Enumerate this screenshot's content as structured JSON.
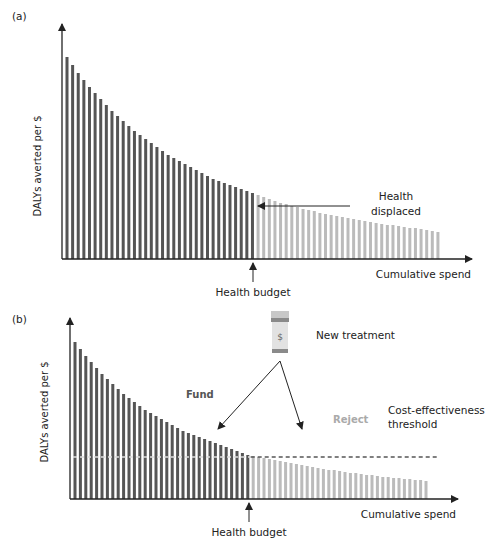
{
  "chart_data": [
    {
      "type": "bar",
      "panel": "(a)",
      "title": "",
      "xlabel": "Cumulative spend",
      "ylabel": "DALYs averted per $",
      "grid": false,
      "legend": null,
      "bar_count": 67,
      "funded_bar_count": 34,
      "values": [
        202,
        194,
        186,
        179,
        172,
        166,
        160,
        154,
        148,
        143,
        138,
        133,
        128,
        124,
        120,
        116,
        112,
        108,
        104,
        101,
        98,
        95,
        92,
        89,
        86,
        83,
        80,
        78,
        76,
        74,
        72,
        70,
        68,
        66,
        64,
        62,
        60,
        58,
        56,
        55,
        53,
        52,
        50,
        49,
        48,
        46,
        45,
        44,
        43,
        42,
        41,
        40,
        39,
        38,
        37,
        36,
        35,
        34,
        34,
        33,
        32,
        31,
        31,
        30,
        29,
        28,
        27
      ],
      "series": [
        {
          "name": "Funded (within budget)",
          "color": "#555555",
          "range": [
            0,
            33
          ]
        },
        {
          "name": "Unfunded (beyond budget)",
          "color": "#bbbbbb",
          "range": [
            34,
            66
          ]
        }
      ],
      "annotations": [
        {
          "text": "Health budget",
          "type": "arrow-up",
          "at_bar": 33
        },
        {
          "text": "Health displaced",
          "type": "arrow-left",
          "at_bar": 34
        }
      ]
    },
    {
      "type": "bar",
      "panel": "(b)",
      "title": "",
      "xlabel": "Cumulative spend",
      "ylabel": "DALYs averted per $",
      "grid": false,
      "legend": null,
      "bar_count": 66,
      "funded_bar_count": 33,
      "values": [
        157,
        150,
        143,
        137,
        131,
        125,
        120,
        115,
        110,
        105,
        101,
        97,
        93,
        89,
        86,
        83,
        80,
        77,
        74,
        71,
        68,
        66,
        64,
        62,
        60,
        58,
        56,
        54,
        52,
        50,
        48,
        46,
        44,
        43,
        42,
        41,
        40,
        39,
        38,
        37,
        36,
        35,
        34,
        33,
        32,
        31,
        30,
        29,
        29,
        28,
        27,
        26,
        26,
        25,
        24,
        24,
        23,
        22,
        22,
        21,
        21,
        20,
        20,
        19,
        19,
        18
      ],
      "threshold": 42,
      "series": [
        {
          "name": "Funded",
          "color": "#555555",
          "range": [
            0,
            32
          ]
        },
        {
          "name": "Rejected",
          "color": "#bbbbbb",
          "range": [
            33,
            65
          ]
        }
      ],
      "annotations": [
        {
          "text": "Health budget",
          "type": "arrow-up",
          "at_bar": 32
        },
        {
          "text": "New treatment",
          "type": "icon-pill-bottle"
        },
        {
          "text": "Fund",
          "type": "label"
        },
        {
          "text": "Reject",
          "type": "label"
        },
        {
          "text": "Cost-effectiveness threshold",
          "type": "dashed-line"
        }
      ]
    }
  ],
  "panel_a": {
    "label": "(a)",
    "ylabel": "DALYs averted per $",
    "xlabel": "Cumulative spend",
    "budget_label": "Health budget",
    "displaced_line1": "Health",
    "displaced_line2": "displaced"
  },
  "panel_b": {
    "label": "(b)",
    "ylabel": "DALYs averted per $",
    "xlabel": "Cumulative spend",
    "budget_label": "Health budget",
    "new_treatment": "New treatment",
    "pill_symbol": "$",
    "fund": "Fund",
    "reject": "Reject",
    "threshold_line1": "Cost-effectiveness",
    "threshold_line2": "threshold"
  },
  "colors": {
    "funded": "#555555",
    "unfunded": "#bbbbbb",
    "axis": "#222222",
    "threshold_light": "#dddddd",
    "threshold_dark": "#555555"
  }
}
